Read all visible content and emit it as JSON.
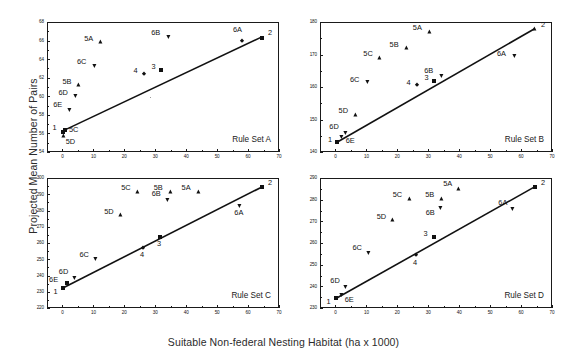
{
  "figure": {
    "xlabel": "Suitable Non-federal Nesting Habitat (ha x 1000)",
    "ylabel": "Projected Mean Number of Pairs"
  },
  "chart_data": [
    {
      "type": "scatter",
      "title": "Rule Set A",
      "xlabel": "Suitable Non-federal Nesting Habitat (ha x 1000)",
      "ylabel": "Projected Mean Number of Pairs",
      "xlim": [
        -5,
        70
      ],
      "ylim": [
        54,
        68
      ],
      "xticks": [
        0,
        10,
        20,
        30,
        40,
        50,
        60,
        70
      ],
      "yticks": [
        54,
        56,
        58,
        60,
        62,
        64,
        66,
        68
      ],
      "grid": false,
      "legend": "none",
      "points": [
        {
          "label": "1",
          "marker": "square",
          "x": 0.3,
          "y": 56.2
        },
        {
          "label": "2",
          "marker": "square",
          "x": 64.5,
          "y": 66.3
        },
        {
          "label": "3",
          "marker": "square",
          "x": 32.0,
          "y": 62.8
        },
        {
          "label": "4",
          "marker": "diamond",
          "x": 26.5,
          "y": 62.4
        },
        {
          "label": "5A",
          "marker": "triangle-up",
          "x": 12.5,
          "y": 65.8
        },
        {
          "label": "5B",
          "marker": "triangle-up",
          "x": 5.5,
          "y": 61.2
        },
        {
          "label": "5C",
          "marker": "square",
          "x": 0.8,
          "y": 56.4
        },
        {
          "label": "5D",
          "marker": "triangle-up",
          "x": 0.4,
          "y": 55.7
        },
        {
          "label": "6A",
          "marker": "diamond",
          "x": 58.0,
          "y": 66.0
        },
        {
          "label": "6B",
          "marker": "triangle-down",
          "x": 34.5,
          "y": 66.4
        },
        {
          "label": "6C",
          "marker": "triangle-down",
          "x": 10.5,
          "y": 63.3
        },
        {
          "label": "6D",
          "marker": "triangle-down",
          "x": 4.5,
          "y": 60.0
        },
        {
          "label": "6E",
          "marker": "triangle-down",
          "x": 2.5,
          "y": 58.5
        }
      ],
      "fit_line": {
        "x0": 0.3,
        "y0": 56.3,
        "x1": 64.5,
        "y1": 66.4
      }
    },
    {
      "type": "scatter",
      "title": "Rule Set B",
      "xlabel": "Suitable Non-federal Nesting Habitat (ha x 1000)",
      "ylabel": "Projected Mean Number of Pairs",
      "xlim": [
        -5,
        70
      ],
      "ylim": [
        140,
        180
      ],
      "xticks": [
        0,
        10,
        20,
        30,
        40,
        50,
        60,
        70
      ],
      "yticks": [
        140,
        150,
        160,
        170,
        180
      ],
      "grid": false,
      "legend": "none",
      "points": [
        {
          "label": "1",
          "marker": "square",
          "x": 0.5,
          "y": 143.0
        },
        {
          "label": "2",
          "marker": "triangle-up",
          "x": 64.5,
          "y": 178.0
        },
        {
          "label": "3",
          "marker": "square",
          "x": 32.0,
          "y": 161.8
        },
        {
          "label": "4",
          "marker": "diamond",
          "x": 26.5,
          "y": 160.5
        },
        {
          "label": "5A",
          "marker": "triangle-up",
          "x": 30.5,
          "y": 177.0
        },
        {
          "label": "5B",
          "marker": "triangle-up",
          "x": 23.0,
          "y": 172.0
        },
        {
          "label": "5C",
          "marker": "triangle-up",
          "x": 14.5,
          "y": 169.0
        },
        {
          "label": "5D",
          "marker": "triangle-up",
          "x": 6.5,
          "y": 151.5
        },
        {
          "label": "6A",
          "marker": "triangle-down",
          "x": 58.0,
          "y": 169.5
        },
        {
          "label": "6B",
          "marker": "triangle-down",
          "x": 34.5,
          "y": 163.5
        },
        {
          "label": "6C",
          "marker": "triangle-down",
          "x": 10.5,
          "y": 161.5
        },
        {
          "label": "6D",
          "marker": "triangle-down",
          "x": 3.5,
          "y": 146.0
        },
        {
          "label": "6E",
          "marker": "triangle-down",
          "x": 2.0,
          "y": 144.5
        }
      ],
      "fit_line": {
        "x0": 0.5,
        "y0": 143.0,
        "x1": 64.5,
        "y1": 178.0
      }
    },
    {
      "type": "scatter",
      "title": "Rule Set C",
      "xlabel": "Suitable Non-federal Nesting Habitat (ha x 1000)",
      "ylabel": "Projected Mean Number of Pairs",
      "xlim": [
        -5,
        70
      ],
      "ylim": [
        220,
        300
      ],
      "xticks": [
        0,
        10,
        20,
        30,
        40,
        50,
        60,
        70
      ],
      "yticks": [
        220,
        230,
        240,
        250,
        260,
        270,
        280,
        290,
        300
      ],
      "grid": false,
      "legend": "none",
      "points": [
        {
          "label": "1",
          "marker": "square",
          "x": 0.3,
          "y": 232.5
        },
        {
          "label": "2",
          "marker": "square",
          "x": 64.5,
          "y": 294.5
        },
        {
          "label": "3",
          "marker": "square",
          "x": 31.5,
          "y": 263.5
        },
        {
          "label": "4",
          "marker": "diamond",
          "x": 26.0,
          "y": 257.0
        },
        {
          "label": "5A",
          "marker": "triangle-up",
          "x": 44.0,
          "y": 291.5
        },
        {
          "label": "5B",
          "marker": "triangle-up",
          "x": 35.0,
          "y": 291.5
        },
        {
          "label": "5C",
          "marker": "triangle-up",
          "x": 24.5,
          "y": 291.5
        },
        {
          "label": "5D",
          "marker": "triangle-up",
          "x": 19.0,
          "y": 277.0
        },
        {
          "label": "6A",
          "marker": "triangle-down",
          "x": 57.5,
          "y": 283.0
        },
        {
          "label": "6B",
          "marker": "triangle-down",
          "x": 34.0,
          "y": 286.5
        },
        {
          "label": "6C",
          "marker": "triangle-down",
          "x": 11.0,
          "y": 250.0
        },
        {
          "label": "6D",
          "marker": "triangle-down",
          "x": 4.0,
          "y": 238.5
        },
        {
          "label": "6E",
          "marker": "square",
          "x": 1.5,
          "y": 235.5
        }
      ],
      "fit_line": {
        "x0": 0.3,
        "y0": 232.5,
        "x1": 64.5,
        "y1": 294.5
      }
    },
    {
      "type": "scatter",
      "title": "Rule Set D",
      "xlabel": "Suitable Non-federal Nesting Habitat (ha x 1000)",
      "ylabel": "Projected Mean Number of Pairs",
      "xlim": [
        -5,
        70
      ],
      "ylim": [
        230,
        290
      ],
      "xticks": [
        0,
        10,
        20,
        30,
        40,
        50,
        60,
        70
      ],
      "yticks": [
        230,
        240,
        250,
        260,
        270,
        280,
        290
      ],
      "grid": false,
      "legend": "none",
      "points": [
        {
          "label": "1",
          "marker": "square",
          "x": 0.3,
          "y": 234.5
        },
        {
          "label": "2",
          "marker": "square",
          "x": 64.5,
          "y": 286.0
        },
        {
          "label": "3",
          "marker": "square",
          "x": 32.0,
          "y": 263.0
        },
        {
          "label": "4",
          "marker": "diamond",
          "x": 26.0,
          "y": 254.5
        },
        {
          "label": "5A",
          "marker": "triangle-up",
          "x": 40.0,
          "y": 285.0
        },
        {
          "label": "5B",
          "marker": "triangle-up",
          "x": 34.5,
          "y": 280.5
        },
        {
          "label": "5C",
          "marker": "triangle-up",
          "x": 24.0,
          "y": 280.5
        },
        {
          "label": "5D",
          "marker": "triangle-up",
          "x": 18.5,
          "y": 270.5
        },
        {
          "label": "6A",
          "marker": "triangle-down",
          "x": 57.5,
          "y": 275.5
        },
        {
          "label": "6B",
          "marker": "triangle-down",
          "x": 34.0,
          "y": 276.0
        },
        {
          "label": "6C",
          "marker": "triangle-down",
          "x": 11.0,
          "y": 255.5
        },
        {
          "label": "6D",
          "marker": "triangle-down",
          "x": 3.5,
          "y": 239.5
        },
        {
          "label": "6E",
          "marker": "triangle-down",
          "x": 2.0,
          "y": 236.0
        }
      ],
      "fit_line": {
        "x0": 0.3,
        "y0": 234.5,
        "x1": 64.5,
        "y1": 286.0
      }
    }
  ],
  "panel_geometry": [
    {
      "left": 47,
      "top": 22,
      "width": 232,
      "height": 130
    },
    {
      "left": 320,
      "top": 22,
      "width": 232,
      "height": 130
    },
    {
      "left": 47,
      "top": 178,
      "width": 232,
      "height": 130
    },
    {
      "left": 320,
      "top": 178,
      "width": 232,
      "height": 130
    }
  ],
  "label_offsets": {
    "A": {
      "1": {
        "dx": -11,
        "dy": -4
      },
      "2": {
        "dx": 6,
        "dy": -5
      },
      "3": {
        "dx": -10,
        "dy": -4
      },
      "4": {
        "dx": -11,
        "dy": -4
      },
      "5A": {
        "dx": -17,
        "dy": -4
      },
      "5B": {
        "dx": -17,
        "dy": -4
      },
      "5C": {
        "dx": 4,
        "dy": 0
      },
      "5D": {
        "dx": 2,
        "dy": 5
      },
      "6A": {
        "dx": -9,
        "dy": -11
      },
      "6B": {
        "dx": -18,
        "dy": -4
      },
      "6C": {
        "dx": -18,
        "dy": -4
      },
      "6D": {
        "dx": -18,
        "dy": -4
      },
      "6E": {
        "dx": -17,
        "dy": -6
      }
    },
    "B": {
      "1": {
        "dx": -9,
        "dy": -3
      },
      "2": {
        "dx": 6,
        "dy": -4
      },
      "3": {
        "dx": -10,
        "dy": -4
      },
      "4": {
        "dx": -11,
        "dy": -3
      },
      "5A": {
        "dx": -17,
        "dy": -4
      },
      "5B": {
        "dx": -17,
        "dy": -4
      },
      "5C": {
        "dx": -17,
        "dy": -4
      },
      "5D": {
        "dx": -17,
        "dy": -4
      },
      "6A": {
        "dx": -18,
        "dy": -3
      },
      "6B": {
        "dx": -18,
        "dy": -5
      },
      "6C": {
        "dx": -18,
        "dy": -3
      },
      "6D": {
        "dx": -17,
        "dy": -6
      },
      "6E": {
        "dx": 4,
        "dy": 3
      }
    },
    "C": {
      "1": {
        "dx": -10,
        "dy": 4
      },
      "2": {
        "dx": 6,
        "dy": -4
      },
      "3": {
        "dx": -3,
        "dy": 6
      },
      "4": {
        "dx": -3,
        "dy": 7
      },
      "5A": {
        "dx": -17,
        "dy": -4
      },
      "5B": {
        "dx": -17,
        "dy": -4
      },
      "5C": {
        "dx": -17,
        "dy": -4
      },
      "5D": {
        "dx": -17,
        "dy": -4
      },
      "6A": {
        "dx": -6,
        "dy": 7
      },
      "6B": {
        "dx": -16,
        "dy": -6
      },
      "6C": {
        "dx": -17,
        "dy": -5
      },
      "6D": {
        "dx": -16,
        "dy": -6
      },
      "6E": {
        "dx": -18,
        "dy": -3
      }
    },
    "D": {
      "1": {
        "dx": -10,
        "dy": 3
      },
      "2": {
        "dx": 6,
        "dy": -4
      },
      "3": {
        "dx": -11,
        "dy": -3
      },
      "4": {
        "dx": -3,
        "dy": 8
      },
      "5A": {
        "dx": -16,
        "dy": -5
      },
      "5B": {
        "dx": -17,
        "dy": -4
      },
      "5C": {
        "dx": -17,
        "dy": -4
      },
      "5D": {
        "dx": -16,
        "dy": -4
      },
      "6A": {
        "dx": -15,
        "dy": -7
      },
      "6B": {
        "dx": -15,
        "dy": 4
      },
      "6C": {
        "dx": -17,
        "dy": -5
      },
      "6D": {
        "dx": -16,
        "dy": -7
      },
      "6E": {
        "dx": 3,
        "dy": 4
      }
    }
  }
}
